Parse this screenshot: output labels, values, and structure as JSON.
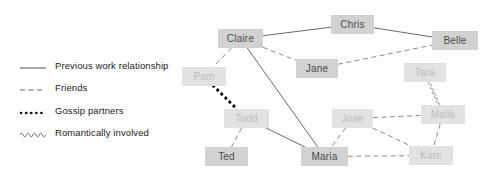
{
  "diagram": {
    "width": 492,
    "height": 184,
    "background": "#ffffff"
  },
  "legend": {
    "title": "Relationship types",
    "items": [
      {
        "id": "previous-work",
        "label": "Previous work relationship",
        "style": "solid",
        "color": "#555555",
        "y": 66
      },
      {
        "id": "friends",
        "label": "Friends",
        "style": "dashed",
        "color": "#666666",
        "y": 88
      },
      {
        "id": "gossip",
        "label": "Gossip partners",
        "style": "dotted",
        "color": "#111111",
        "y": 111
      },
      {
        "id": "romantic",
        "label": "Romantically involved",
        "style": "wavy",
        "color": "#777777",
        "y": 133
      }
    ]
  },
  "graph": {
    "nodes": [
      {
        "id": "claire",
        "label": "Claire",
        "x": 218,
        "y": 29,
        "w": 45,
        "h": 19,
        "emphasis": "strong"
      },
      {
        "id": "chris",
        "label": "Chris",
        "x": 331,
        "y": 15,
        "w": 43,
        "h": 19,
        "emphasis": "strong"
      },
      {
        "id": "belle",
        "label": "Belle",
        "x": 432,
        "y": 31,
        "w": 46,
        "h": 19,
        "emphasis": "strong"
      },
      {
        "id": "jane",
        "label": "Jane",
        "x": 296,
        "y": 59,
        "w": 42,
        "h": 19,
        "emphasis": "strong"
      },
      {
        "id": "pam",
        "label": "Pam",
        "x": 182,
        "y": 67,
        "w": 44,
        "h": 19,
        "emphasis": "faded"
      },
      {
        "id": "tara",
        "label": "Tara",
        "x": 404,
        "y": 63,
        "w": 42,
        "h": 19,
        "emphasis": "faded"
      },
      {
        "id": "todd",
        "label": "Todd",
        "x": 224,
        "y": 109,
        "w": 45,
        "h": 19,
        "emphasis": "faded"
      },
      {
        "id": "jose",
        "label": "Jose",
        "x": 332,
        "y": 109,
        "w": 41,
        "h": 19,
        "emphasis": "faded"
      },
      {
        "id": "malik",
        "label": "Malik",
        "x": 421,
        "y": 105,
        "w": 44,
        "h": 19,
        "emphasis": "faded"
      },
      {
        "id": "ted",
        "label": "Ted",
        "x": 205,
        "y": 147,
        "w": 43,
        "h": 19,
        "emphasis": "strong"
      },
      {
        "id": "maria",
        "label": "Maria",
        "x": 301,
        "y": 147,
        "w": 47,
        "h": 19,
        "emphasis": "strong"
      },
      {
        "id": "kate",
        "label": "Kate",
        "x": 409,
        "y": 146,
        "w": 44,
        "h": 19,
        "emphasis": "faded"
      }
    ],
    "edges": [
      {
        "source": "claire",
        "target": "chris",
        "type": "previous-work"
      },
      {
        "source": "chris",
        "target": "belle",
        "type": "previous-work"
      },
      {
        "source": "claire",
        "target": "jane",
        "type": "friends"
      },
      {
        "source": "jane",
        "target": "belle",
        "type": "friends"
      },
      {
        "source": "claire",
        "target": "pam",
        "type": "friends"
      },
      {
        "source": "claire",
        "target": "maria",
        "type": "previous-work"
      },
      {
        "source": "pam",
        "target": "todd",
        "type": "gossip"
      },
      {
        "source": "todd",
        "target": "ted",
        "type": "friends"
      },
      {
        "source": "todd",
        "target": "maria",
        "type": "previous-work"
      },
      {
        "source": "tara",
        "target": "malik",
        "type": "romantic"
      },
      {
        "source": "jose",
        "target": "malik",
        "type": "friends"
      },
      {
        "source": "jose",
        "target": "maria",
        "type": "friends"
      },
      {
        "source": "jose",
        "target": "kate",
        "type": "friends"
      },
      {
        "source": "malik",
        "target": "kate",
        "type": "friends"
      },
      {
        "source": "maria",
        "target": "kate",
        "type": "friends"
      }
    ]
  }
}
